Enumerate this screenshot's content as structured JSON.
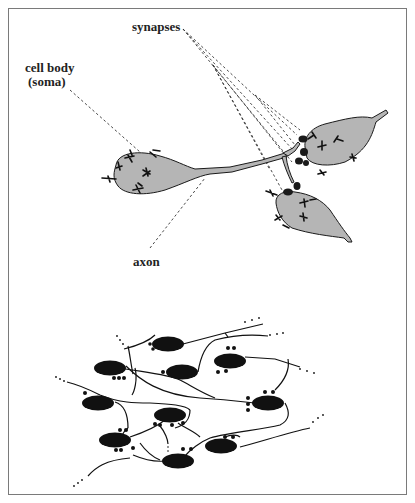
{
  "figure": {
    "type": "neuron schematic",
    "labels": {
      "synapses": "synapses",
      "cell_body_line1": "cell body",
      "cell_body_line2": "(soma)",
      "axon": "axon"
    },
    "colors": {
      "soma_fill": "#b5b5b5",
      "outline": "#1a1a1a",
      "network_node": "#111111",
      "frame": "#7a7a7a",
      "leader_line": "#333333"
    },
    "top_panel": {
      "neurons": [
        "presynaptic neuron (left)",
        "postsynaptic neuron (upper right)",
        "postsynaptic neuron (lower right)"
      ]
    },
    "bottom_panel": {
      "description": "network of interconnected neurons",
      "node_count": 10
    }
  }
}
